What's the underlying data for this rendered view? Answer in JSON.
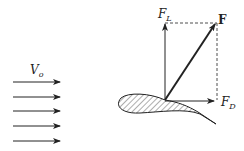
{
  "diagram": {
    "labels": {
      "velocity": {
        "main": "V",
        "sub": "o"
      },
      "lift": {
        "main": "F",
        "sub": "L"
      },
      "drag": {
        "main": "F",
        "sub": "D"
      },
      "resultant": "F"
    },
    "flow_arrows": 5,
    "colors": {
      "stroke": "#222222",
      "background": "#ffffff"
    }
  }
}
